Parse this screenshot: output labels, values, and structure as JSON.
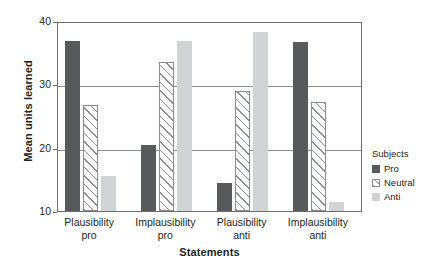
{
  "chart_data": {
    "type": "bar",
    "title": "",
    "xlabel": "Statements",
    "ylabel": "Mean units learned",
    "categories": [
      "Plausibility pro",
      "Implausibility pro",
      "Plausibility anti",
      "Implausibility anti"
    ],
    "category_lines": [
      [
        "Plausibility",
        "pro"
      ],
      [
        "Implausibility",
        "pro"
      ],
      [
        "Plausibility",
        "anti"
      ],
      [
        "Implausibility",
        "anti"
      ]
    ],
    "series": [
      {
        "name": "Pro",
        "values": [
          36.8,
          20.5,
          14.5,
          36.7
        ]
      },
      {
        "name": "Neutral",
        "values": [
          26.7,
          33.5,
          29.0,
          27.2
        ]
      },
      {
        "name": "Anti",
        "values": [
          15.6,
          36.8,
          38.2,
          11.5
        ]
      }
    ],
    "ylim": [
      10,
      40
    ],
    "yticks": [
      10,
      20,
      30,
      40
    ],
    "ytick_labels": [
      "10",
      "20",
      "30",
      "40"
    ],
    "grid": true,
    "grid_axis": "y",
    "legend_position": "right",
    "legend_title": "Subjects",
    "colors": {
      "pro": "#58595b",
      "neutral": "#ffffff",
      "neutral_hatch": "#8a8c8e",
      "anti": "#d2d3d4",
      "axis": "#6d6e71",
      "grid": "#8a8c8e",
      "text": "#231f20"
    }
  }
}
